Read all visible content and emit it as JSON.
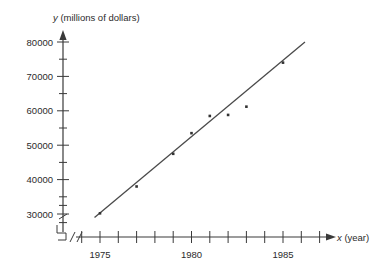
{
  "chart_data": {
    "type": "scatter",
    "title": "",
    "xlabel": "x (year)",
    "ylabel": "y (millions of dollars)",
    "xlabel_var": "x",
    "xlabel_unit": "(year)",
    "ylabel_var": "y",
    "ylabel_unit": "(millions of dollars)",
    "xlim": [
      1974,
      1987
    ],
    "ylim": [
      27500,
      82500
    ],
    "grid": false,
    "legend": null,
    "axis_break": true,
    "x_tick_labels": [
      "1975",
      "1980",
      "1985"
    ],
    "x_tick_label_values": [
      1975,
      1980,
      1985
    ],
    "x_major_ticks": [
      1974,
      1975,
      1976,
      1977,
      1978,
      1979,
      1980,
      1981,
      1982,
      1983,
      1984,
      1985,
      1986,
      1987
    ],
    "y_tick_labels": [
      "30000",
      "40000",
      "50000",
      "60000",
      "70000",
      "80000"
    ],
    "y_tick_label_values": [
      30000,
      40000,
      50000,
      60000,
      70000,
      80000
    ],
    "y_minor_ticks": [
      27500,
      32500,
      35000,
      45000,
      55000,
      65000,
      75000
    ],
    "points": [
      {
        "x": 1975,
        "y": 30200
      },
      {
        "x": 1977,
        "y": 38000
      },
      {
        "x": 1979,
        "y": 47500
      },
      {
        "x": 1980,
        "y": 53500
      },
      {
        "x": 1981,
        "y": 58500
      },
      {
        "x": 1982,
        "y": 58800
      },
      {
        "x": 1983,
        "y": 61200
      },
      {
        "x": 1985,
        "y": 74000
      }
    ],
    "series": [
      {
        "name": "data points",
        "x": [
          1975,
          1977,
          1979,
          1980,
          1981,
          1982,
          1983,
          1985
        ],
        "values": [
          30200,
          38000,
          47500,
          53500,
          58500,
          58800,
          61200,
          74000
        ]
      }
    ],
    "trend_line": {
      "name": "line of best fit",
      "x_start": 1974.7,
      "y_start": 29000,
      "x_end": 1986.2,
      "y_end": 80000
    },
    "colors": {
      "axis": "#3a3a3a",
      "point": "#333333",
      "line": "#4a4a4a",
      "background": "#ffffff",
      "text": "#2b2b2b"
    }
  }
}
